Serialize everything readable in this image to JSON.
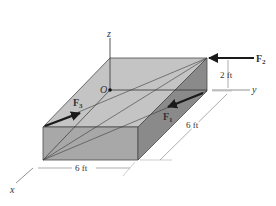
{
  "figure": {
    "axes": {
      "z": "z",
      "y": "y",
      "x": "x"
    },
    "origin_label": "O",
    "forces": [
      {
        "name": "F",
        "sub": "1"
      },
      {
        "name": "F",
        "sub": "2"
      },
      {
        "name": "F",
        "sub": "3"
      }
    ],
    "dimensions": {
      "height": "2 ft",
      "depth": "6 ft",
      "width": "6 ft"
    },
    "colors": {
      "top_face": "#c4c4c4",
      "front_face": "#a8a8a8",
      "side_face": "#8a8a8a",
      "edge": "#4a4a4a",
      "arrow": "#1a1a1a"
    }
  }
}
